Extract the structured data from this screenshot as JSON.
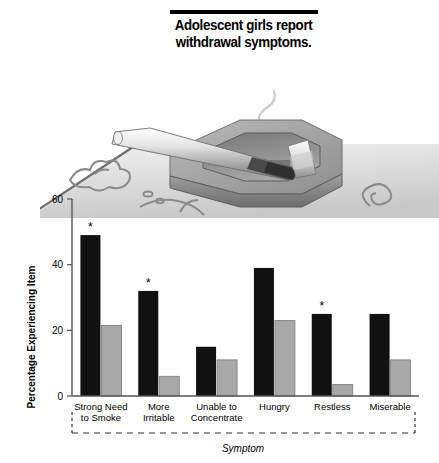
{
  "title": {
    "line1": "Adolescent girls report",
    "line2": "withdrawal symptoms.",
    "full": "Adolescent girls report\nwithdrawal symptoms."
  },
  "illustration": {
    "name": "cigarette-in-ashtray-illustration",
    "description": "Lit cigarette resting on a gray octagonal ashtray on a patterned surface with rising smoke"
  },
  "colors": {
    "dark_bar": "#111111",
    "light_bar": "#a8a8a8",
    "axis": "#555555",
    "text": "#000000",
    "background": "#ffffff"
  },
  "chart_data": {
    "type": "bar",
    "title": "",
    "xlabel": "Symptom",
    "ylabel": "Percentage Experiencing Item",
    "ylim": [
      0,
      60
    ],
    "yticks": [
      "0",
      "20",
      "40",
      "60"
    ],
    "ytick_values": [
      0,
      20,
      40,
      60
    ],
    "grid": false,
    "legend_position": "none",
    "categories": [
      "Strong Need\nto Smoke",
      "More\nIrritable",
      "Unable to\nConcentrate",
      "Hungry",
      "Restless",
      "Miserable"
    ],
    "category_lines": [
      [
        "Strong Need",
        "to Smoke"
      ],
      [
        "More",
        "Irritable"
      ],
      [
        "Unable to",
        "Concentrate"
      ],
      [
        "Hungry",
        ""
      ],
      [
        "Restless",
        ""
      ],
      [
        "Miserable",
        ""
      ]
    ],
    "series": [
      {
        "name": "dark",
        "color": "#111111",
        "values": [
          49,
          32,
          15,
          39,
          25,
          25
        ]
      },
      {
        "name": "light",
        "color": "#a8a8a8",
        "values": [
          21.5,
          6,
          11,
          23,
          3.5,
          11
        ]
      }
    ],
    "significance_marker": "*",
    "significant_categories": [
      "Strong Need\nto Smoke",
      "More\nIrritable",
      "Restless"
    ],
    "significance_flags": [
      true,
      true,
      false,
      false,
      true,
      false
    ]
  }
}
